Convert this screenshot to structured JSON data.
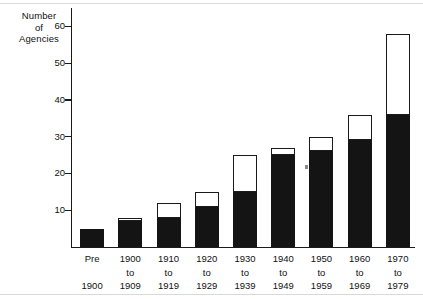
{
  "chart_data": {
    "type": "bar",
    "title": "",
    "subtitle": "",
    "xlabel": "",
    "ylabel": "Number of Agencies",
    "ylabel_lines": [
      "Number",
      "of",
      "Agencies"
    ],
    "ylim": [
      0,
      65
    ],
    "yticks": [
      10,
      20,
      30,
      40,
      50,
      60
    ],
    "ytick_labels": [
      "10",
      "20",
      "30",
      "40",
      "50",
      "60"
    ],
    "grid": false,
    "legend": "none",
    "stacked": true,
    "categories": [
      "Pre 1900",
      "1900 to 1909",
      "1910 to 1919",
      "1920 to 1929",
      "1930 to 1939",
      "1940 to 1949",
      "1950 to 1959",
      "1960 to 1969",
      "1970 to 1979"
    ],
    "category_label_lines": [
      [
        "Pre",
        "",
        "1900"
      ],
      [
        "1900",
        "to",
        "1909"
      ],
      [
        "1910",
        "to",
        "1919"
      ],
      [
        "1920",
        "to",
        "1929"
      ],
      [
        "1930",
        "to",
        "1939"
      ],
      [
        "1940",
        "to",
        "1949"
      ],
      [
        "1950",
        "to",
        "1959"
      ],
      [
        "1960",
        "to",
        "1969"
      ],
      [
        "1970",
        "to",
        "1979"
      ]
    ],
    "series": [
      {
        "name": "black-segment",
        "color": "#141414",
        "values": [
          5,
          7,
          8,
          11,
          15,
          25,
          26,
          29,
          36
        ]
      },
      {
        "name": "white-segment",
        "color": "#ffffff",
        "values": [
          0,
          1,
          4,
          4,
          10,
          2,
          4,
          7,
          22
        ]
      }
    ],
    "totals": [
      5,
      8,
      12,
      15,
      25,
      27,
      30,
      36,
      58
    ],
    "annotations": []
  },
  "colors": {
    "axis": "#1a1a1a",
    "bar_filled": "#141414",
    "bar_open": "#ffffff",
    "rule": "#d9d9d9",
    "text": "#111111",
    "artifact": "#8c8c8c"
  }
}
